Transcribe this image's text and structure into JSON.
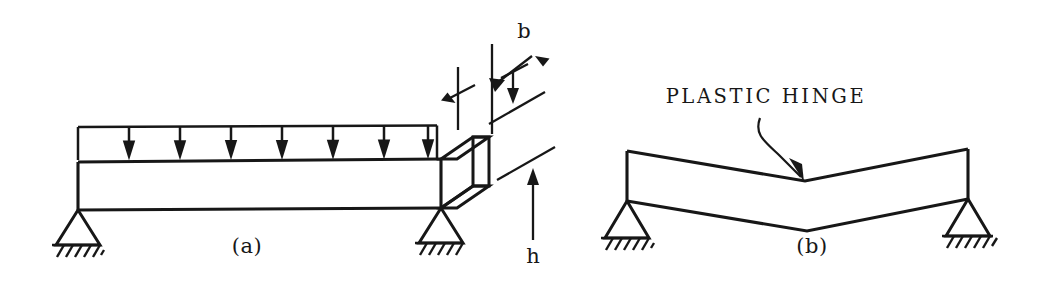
{
  "figure": {
    "background_color": "#ffffff",
    "ink_color": "#171717",
    "panels": [
      {
        "id": "a",
        "label": "(a)",
        "caption_role": "loaded simply supported beam with cross section",
        "load": {
          "type": "uniformly-distributed-load",
          "arrow_count": 7,
          "direction": "down"
        },
        "dimensions": [
          {
            "symbol": "b",
            "meaning": "cross-section width",
            "leader": "diagonal-arrow"
          },
          {
            "symbol": "h",
            "meaning": "cross-section depth",
            "leader": "vertical-arrow"
          }
        ],
        "supports": [
          {
            "kind": "pin-support",
            "position": "left"
          },
          {
            "kind": "pin-support",
            "position": "right"
          }
        ]
      },
      {
        "id": "b",
        "label": "(b)",
        "caption_role": "collapse mechanism",
        "callout": {
          "text": "PLASTIC HINGE",
          "leader": "curved-arrow",
          "points_to": "midspan-kink"
        },
        "supports": [
          {
            "kind": "pin-support",
            "position": "left"
          },
          {
            "kind": "pin-support",
            "position": "right"
          }
        ]
      }
    ]
  },
  "labels": {
    "panel_a": "(a)",
    "panel_b": "(b)",
    "dim_b": "b",
    "dim_h": "h",
    "plastic_hinge": "PLASTIC HINGE"
  }
}
